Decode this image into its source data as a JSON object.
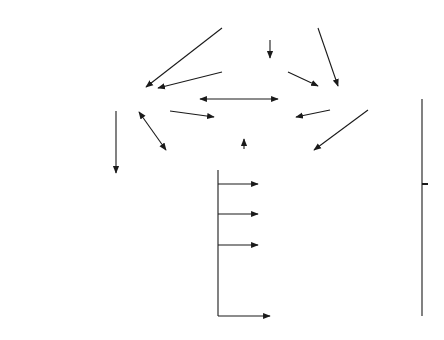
{
  "diagram": {
    "nodes": {
      "root": "Root",
      "country": "Country",
      "locality": "Locality",
      "organization": "Organization",
      "group_of_names": "Group of Names",
      "organizational_unit": "Organizational Unit",
      "residential_person": "Residential Person",
      "organizational_role": "Organizational Role",
      "organizational_person": "Organizational Person",
      "application_process": "Application Process",
      "application_entity": "Application Entity",
      "device": "Device"
    },
    "cycle_marker": "*",
    "edges": [
      {
        "from": "Root",
        "to": "Country"
      },
      {
        "from": "Root",
        "to": "Locality"
      },
      {
        "from": "Root",
        "to": "Organization"
      },
      {
        "from": "Country",
        "to": "Locality"
      },
      {
        "from": "Country",
        "to": "Organization"
      },
      {
        "from": "Locality",
        "to": "Organization",
        "bidirectional": true
      },
      {
        "from": "Locality",
        "to": "Group of Names"
      },
      {
        "from": "Locality",
        "to": "Organizational Unit",
        "bidirectional": true
      },
      {
        "from": "Locality",
        "to": "Residential Person"
      },
      {
        "from": "Organization",
        "to": "Group of Names"
      },
      {
        "from": "Organization",
        "to": "Organizational Unit"
      },
      {
        "from": "Organizational Unit",
        "to": "Group of Names"
      },
      {
        "from": "Organizational Unit",
        "to": "Organizational Role"
      },
      {
        "from": "Organizational Unit",
        "to": "Organizational Person"
      },
      {
        "from": "Organizational Unit",
        "to": "Application Process"
      },
      {
        "from": "Organizational Unit",
        "to": "Device"
      },
      {
        "from": "Organization",
        "to": "Organizational Role"
      },
      {
        "from": "Organization",
        "to": "Organizational Person"
      },
      {
        "from": "Organization",
        "to": "Application Process"
      },
      {
        "from": "Organization",
        "to": "Device"
      },
      {
        "from": "Application Process",
        "to": "Application Entity"
      }
    ],
    "cycles": [
      "Locality",
      "Organizational Unit"
    ]
  },
  "legend": {
    "arrow_label_line1": "Superior/subordinate",
    "arrow_label_line2": "relationship",
    "cycle_label": "May cycle or repeat",
    "cycle_symbol": "*"
  },
  "colors": {
    "stroke": "#1a1a1a",
    "background": "#ffffff",
    "text": "#222222"
  }
}
